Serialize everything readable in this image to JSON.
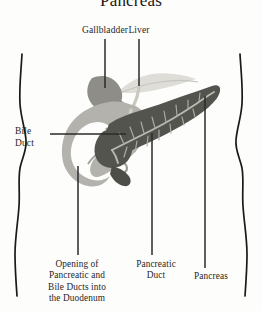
{
  "figure": {
    "title": "Pancreas",
    "type": "anatomical-diagram",
    "labels": {
      "gallbladder": "Gallbladder",
      "liver": "Liver",
      "bile_duct": "Bile\nDuct",
      "opening": "Opening of\nPancreatic and\nBile Ducts into\nthe Duodenum",
      "pancreatic_duct": "Pancreatic\nDuct",
      "pancreas": "Pancreas"
    },
    "colors": {
      "background": "#fdfdfc",
      "pancreas": "#54544f",
      "duodenum": "#b3b2ac",
      "gallbladder": "#8e8d87",
      "liver": "#d9d8d2",
      "duct": "#cfcec7",
      "outline": "#1a1a1a",
      "leader": "#2a2a2a",
      "text": "#262626"
    },
    "structures": [
      {
        "name": "liver",
        "shade": "light"
      },
      {
        "name": "gallbladder",
        "shade": "medium"
      },
      {
        "name": "duodenum",
        "shade": "light-gray"
      },
      {
        "name": "pancreas",
        "shade": "dark-gray"
      },
      {
        "name": "pancreatic-duct",
        "shade": "pale-branching"
      },
      {
        "name": "common-bile-duct",
        "shade": "pale"
      }
    ],
    "leaders": [
      {
        "name": "gallbladder",
        "orientation": "vertical"
      },
      {
        "name": "liver",
        "orientation": "vertical"
      },
      {
        "name": "bile-duct",
        "orientation": "horizontal"
      },
      {
        "name": "opening",
        "orientation": "vertical"
      },
      {
        "name": "pancreatic-duct",
        "orientation": "vertical"
      },
      {
        "name": "pancreas",
        "orientation": "vertical"
      }
    ]
  }
}
